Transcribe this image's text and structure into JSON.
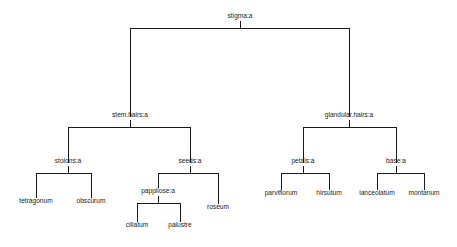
{
  "figure": {
    "title": "",
    "background_color": "#ffffff",
    "line_color": "#1a1a1a",
    "text_color": "#1a1a1a",
    "width": 457,
    "height": 247
  },
  "chart_data": {
    "type": "tree",
    "title": "",
    "xlabel": "",
    "ylabel": "",
    "grid": false,
    "legend": null,
    "root": "stigma:a",
    "internal_nodes": [
      "stigma:a",
      "stem.hairs:a",
      "glandular.hairs:a",
      "stolons:a",
      "seeds:a",
      "petals:a",
      "base:a",
      "pappilose:a"
    ],
    "leaves": [
      "tetragonum",
      "obscurum",
      "ciliatum",
      "palustre",
      "roseum",
      "parviflorum",
      "hirsutum",
      "lanceolatum",
      "montanum"
    ],
    "edges": [
      {
        "from": "stigma:a",
        "to": "stem.hairs:a"
      },
      {
        "from": "stigma:a",
        "to": "glandular.hairs:a"
      },
      {
        "from": "stem.hairs:a",
        "to": "stolons:a"
      },
      {
        "from": "stem.hairs:a",
        "to": "seeds:a"
      },
      {
        "from": "stolons:a",
        "to": "tetragonum"
      },
      {
        "from": "stolons:a",
        "to": "obscurum"
      },
      {
        "from": "seeds:a",
        "to": "pappilose:a"
      },
      {
        "from": "seeds:a",
        "to": "roseum"
      },
      {
        "from": "pappilose:a",
        "to": "ciliatum"
      },
      {
        "from": "pappilose:a",
        "to": "palustre"
      },
      {
        "from": "glandular.hairs:a",
        "to": "petals:a"
      },
      {
        "from": "glandular.hairs:a",
        "to": "base:a"
      },
      {
        "from": "petals:a",
        "to": "parviflorum"
      },
      {
        "from": "petals:a",
        "to": "hirsutum"
      },
      {
        "from": "base:a",
        "to": "lanceolatum"
      },
      {
        "from": "base:a",
        "to": "montanum"
      }
    ],
    "nodes": [
      {
        "id": "stigma",
        "label": "stigma:a",
        "x": 240,
        "y": 18,
        "kind": "internal"
      },
      {
        "id": "stem_hairs",
        "label": "stem.hairs:a",
        "x": 130,
        "y": 117,
        "kind": "internal"
      },
      {
        "id": "glandular_hairs",
        "label": "glandular.hairs:a",
        "x": 349,
        "y": 117,
        "kind": "internal"
      },
      {
        "id": "stolons",
        "label": "stolons:a",
        "x": 68,
        "y": 163,
        "kind": "internal"
      },
      {
        "id": "seeds",
        "label": "seeds:a",
        "x": 190,
        "y": 163,
        "kind": "internal"
      },
      {
        "id": "petals",
        "label": "petals:a",
        "x": 303,
        "y": 163,
        "kind": "internal"
      },
      {
        "id": "base",
        "label": "base:a",
        "x": 396,
        "y": 163,
        "kind": "internal"
      },
      {
        "id": "pappilose",
        "label": "pappilose:a",
        "x": 158,
        "y": 193,
        "kind": "internal"
      },
      {
        "id": "tetragonum",
        "label": "tetragonum",
        "x": 36,
        "y": 203,
        "kind": "leaf"
      },
      {
        "id": "obscurum",
        "label": "obscurum",
        "x": 91,
        "y": 203,
        "kind": "leaf"
      },
      {
        "id": "roseum",
        "label": "roseum",
        "x": 218,
        "y": 209,
        "kind": "leaf"
      },
      {
        "id": "ciliatum",
        "label": "ciliatum",
        "x": 137,
        "y": 227,
        "kind": "leaf"
      },
      {
        "id": "palustre",
        "label": "palustre",
        "x": 180,
        "y": 227,
        "kind": "leaf"
      },
      {
        "id": "parviflorum",
        "label": "parviflorum",
        "x": 281,
        "y": 195,
        "kind": "leaf"
      },
      {
        "id": "hirsutum",
        "label": "hirsutum",
        "x": 329,
        "y": 195,
        "kind": "leaf"
      },
      {
        "id": "lanceolatum",
        "label": "lanceolatum",
        "x": 377,
        "y": 195,
        "kind": "leaf"
      },
      {
        "id": "montanum",
        "label": "montanum",
        "x": 424,
        "y": 195,
        "kind": "leaf"
      }
    ],
    "segments": [
      {
        "name": "root-stem-tick",
        "points": "240,21 240,28"
      },
      {
        "name": "root-crossbar",
        "points": "130,28 349,28"
      },
      {
        "name": "root-to-stem-hairs",
        "points": "130,28 130,117"
      },
      {
        "name": "root-to-glandular",
        "points": "349,28 349,117"
      },
      {
        "name": "stem-hairs-tick",
        "points": "130,120 130,127"
      },
      {
        "name": "stem-hairs-crossbar",
        "points": "68,127 190,127"
      },
      {
        "name": "stem-hairs-to-stolons",
        "points": "68,127 68,163"
      },
      {
        "name": "stem-hairs-to-seeds",
        "points": "190,127 190,163"
      },
      {
        "name": "stolons-tick",
        "points": "68,166 68,173"
      },
      {
        "name": "stolons-crossbar",
        "points": "36,173 91,173"
      },
      {
        "name": "stolons-to-tetragonum",
        "points": "36,173 36,198"
      },
      {
        "name": "stolons-to-obscurum",
        "points": "91,173 91,198"
      },
      {
        "name": "seeds-tick",
        "points": "190,166 190,173"
      },
      {
        "name": "seeds-crossbar",
        "points": "158,173 218,173"
      },
      {
        "name": "seeds-to-pappilose",
        "points": "158,173 158,188"
      },
      {
        "name": "seeds-to-roseum",
        "points": "218,173 218,204"
      },
      {
        "name": "pappilose-tick",
        "points": "158,196 158,203"
      },
      {
        "name": "pappilose-crossbar",
        "points": "137,203 180,203"
      },
      {
        "name": "pappilose-to-ciliatum",
        "points": "137,203 137,222"
      },
      {
        "name": "pappilose-to-palustre",
        "points": "180,203 180,222"
      },
      {
        "name": "glandular-tick",
        "points": "349,120 349,127"
      },
      {
        "name": "glandular-crossbar",
        "points": "303,127 396,127"
      },
      {
        "name": "glandular-to-petals",
        "points": "303,127 303,163"
      },
      {
        "name": "glandular-to-base",
        "points": "396,127 396,163"
      },
      {
        "name": "petals-tick",
        "points": "303,166 303,173"
      },
      {
        "name": "petals-crossbar",
        "points": "281,173 329,173"
      },
      {
        "name": "petals-to-parviflorum",
        "points": "281,173 281,190"
      },
      {
        "name": "petals-to-hirsutum",
        "points": "329,173 329,190"
      },
      {
        "name": "base-tick",
        "points": "396,166 396,173"
      },
      {
        "name": "base-crossbar",
        "points": "377,173 424,173"
      },
      {
        "name": "base-to-lanceolatum",
        "points": "377,173 377,190"
      },
      {
        "name": "base-to-montanum",
        "points": "424,173 424,190"
      }
    ]
  }
}
